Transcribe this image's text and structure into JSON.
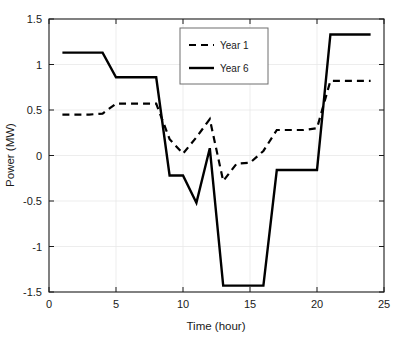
{
  "chart_data": {
    "type": "line",
    "title": "",
    "xlabel": "Time (hour)",
    "ylabel": "Power (MW)",
    "xlim": [
      0,
      25
    ],
    "ylim": [
      -1.5,
      1.5
    ],
    "xticks": [
      "0",
      "5",
      "10",
      "15",
      "20",
      "25"
    ],
    "xtick_values": [
      0,
      5,
      10,
      15,
      20,
      25
    ],
    "yticks": [
      "-1.5",
      "-1",
      "-0.5",
      "0",
      "0.5",
      "1",
      "1.5"
    ],
    "ytick_values": [
      -1.5,
      -1,
      -0.5,
      0,
      0.5,
      1,
      1.5
    ],
    "grid": true,
    "grid_color": "#e8e8e8",
    "legend_position": "top-center",
    "x": [
      1,
      2,
      3,
      4,
      5,
      6,
      7,
      8,
      9,
      10,
      11,
      12,
      13,
      14,
      15,
      16,
      17,
      18,
      19,
      20,
      21,
      22,
      23,
      24
    ],
    "series": [
      {
        "name": "Year 1",
        "style": "dashed",
        "color": "#000000",
        "linewidth": 2.2,
        "values": [
          0.45,
          0.45,
          0.45,
          0.46,
          0.57,
          0.57,
          0.57,
          0.57,
          0.18,
          0.02,
          0.2,
          0.4,
          -0.28,
          -0.09,
          -0.08,
          0.05,
          0.28,
          0.28,
          0.28,
          0.3,
          0.82,
          0.82,
          0.82,
          0.82
        ]
      },
      {
        "name": "Year 6",
        "style": "solid",
        "color": "#000000",
        "linewidth": 2.4,
        "values": [
          1.13,
          1.13,
          1.13,
          1.13,
          0.86,
          0.86,
          0.86,
          0.86,
          -0.22,
          -0.22,
          -0.52,
          0.08,
          -1.43,
          -1.43,
          -1.43,
          -1.43,
          -0.16,
          -0.16,
          -0.16,
          -0.16,
          1.33,
          1.33,
          1.33,
          1.33
        ]
      }
    ]
  },
  "legend": {
    "entries": [
      {
        "label": "Year 1",
        "style": "dashed"
      },
      {
        "label": "Year 6",
        "style": "solid"
      }
    ]
  },
  "colors": {
    "axis": "#1a1a1a",
    "grid": "#e8e8e8",
    "series": "#000000",
    "background": "#ffffff"
  }
}
